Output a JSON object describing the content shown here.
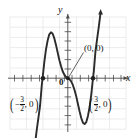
{
  "figure": {
    "kind": "coordinate-plane-graph",
    "axis_labels": {
      "x": "x",
      "y": "y",
      "origin": "0"
    },
    "point_labels": {
      "origin_callout": "(0, 0)",
      "left_intercept_open": "(",
      "left_intercept_sign": "−",
      "left_intercept_num": "3",
      "left_intercept_den": "2",
      "left_intercept_rest": ", 0",
      "left_intercept_close": ")",
      "right_intercept_open": "(",
      "right_intercept_num": "3",
      "right_intercept_den": "2",
      "right_intercept_rest": ", 0",
      "right_intercept_close": ")"
    },
    "colors": {
      "curve": "#2b2b2b",
      "axis": "#4a4a4a",
      "grid": "#e2e2e2",
      "text": "#111111",
      "background": "#ffffff"
    }
  },
  "chart_data": {
    "type": "line",
    "title": "",
    "xlabel": "x",
    "ylabel": "y",
    "grid": true,
    "legend": "none",
    "xlim": [
      -3.6,
      3.6
    ],
    "ylim": [
      -3.2,
      3.2
    ],
    "x_tick_step": 0.5,
    "y_tick_step": 0.5,
    "annotations": [
      {
        "text": "(0, 0)",
        "x": 0,
        "y": 0,
        "leader": true
      },
      {
        "text": "(-3/2, 0)",
        "x": -1.5,
        "y": 0,
        "leader": false
      },
      {
        "text": "(3/2, 0)",
        "x": 1.5,
        "y": 0,
        "leader": false
      }
    ],
    "roots": [
      -1.5,
      0,
      1.5
    ],
    "series": [
      {
        "name": "cubic",
        "x": [
          -1.95,
          -1.85,
          -1.75,
          -1.65,
          -1.55,
          -1.5,
          -1.4,
          -1.3,
          -1.2,
          -1.1,
          -1.0,
          -0.9,
          -0.8,
          -0.7,
          -0.6,
          -0.5,
          -0.4,
          -0.3,
          -0.2,
          -0.1,
          0.0,
          0.1,
          0.2,
          0.3,
          0.4,
          0.5,
          0.6,
          0.7,
          0.8,
          0.9,
          1.0,
          1.1,
          1.2,
          1.3,
          1.4,
          1.5,
          1.55,
          1.65,
          1.75,
          1.85,
          1.95
        ],
        "y": [
          -3.2,
          -2.55,
          -1.95,
          -1.35,
          -0.35,
          0.0,
          0.78,
          1.4,
          1.85,
          2.15,
          2.25,
          2.18,
          1.95,
          1.62,
          1.25,
          0.88,
          0.58,
          0.33,
          0.16,
          0.05,
          0.0,
          -0.05,
          -0.16,
          -0.33,
          -0.58,
          -0.88,
          -1.25,
          -1.62,
          -1.95,
          -2.18,
          -2.25,
          -2.15,
          -1.85,
          -1.4,
          -0.78,
          0.0,
          0.35,
          1.35,
          1.95,
          2.55,
          3.2
        ]
      }
    ]
  }
}
